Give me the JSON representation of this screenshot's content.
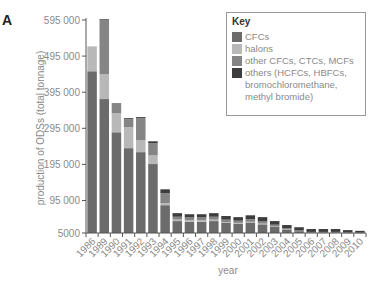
{
  "panel_label": "A",
  "legend": {
    "title": "Key",
    "items": [
      {
        "label": "CFCs",
        "color": "#6b6b6b"
      },
      {
        "label": "halons",
        "color": "#b8b8b8"
      },
      {
        "label": "other CFCs, CTCs, MCFs",
        "color": "#858585"
      },
      {
        "label": "others (HCFCs, HBFCs, bromochloromethane, methyl bromide)",
        "color": "#3d3d3d"
      }
    ]
  },
  "chart_data": {
    "type": "bar",
    "stacked": true,
    "title": "",
    "xlabel": "year",
    "ylabel": "production of ODSs (total tonnage)",
    "ylim": [
      5000,
      595000
    ],
    "yticks": [
      5000,
      95000,
      195000,
      295000,
      395000,
      495000,
      595000
    ],
    "ytick_labels": [
      "5000",
      "95 000",
      "195 000",
      "295 000",
      "395 000",
      "495 000",
      "595 000"
    ],
    "grid": false,
    "legend_position": "upper right",
    "categories": [
      "1986",
      "1989",
      "1990",
      "1991",
      "1992",
      "1993",
      "1994",
      "1995",
      "1996",
      "1997",
      "1998",
      "1999",
      "2000",
      "2001",
      "2002",
      "2003",
      "2004",
      "2005",
      "2006",
      "2007",
      "2008",
      "2009",
      "2010"
    ],
    "series": [
      {
        "name": "CFCs",
        "color": "#6b6b6b",
        "values": [
          448000,
          371000,
          279000,
          235000,
          224000,
          191000,
          77000,
          33000,
          31000,
          31000,
          33000,
          28000,
          26000,
          29000,
          24000,
          18000,
          9000,
          5000,
          2000,
          2000,
          2000,
          1000,
          1000
        ]
      },
      {
        "name": "halons",
        "color": "#b8b8b8",
        "values": [
          69000,
          69000,
          53000,
          58000,
          33000,
          24000,
          6000,
          4000,
          4000,
          4000,
          4000,
          2000,
          2000,
          2000,
          2000,
          1000,
          1000,
          0,
          0,
          0,
          0,
          0,
          0
        ]
      },
      {
        "name": "other CFCs, CTCs, MCFs",
        "color": "#858585",
        "values": [
          0,
          149000,
          28000,
          22000,
          61000,
          34000,
          27000,
          8000,
          8000,
          8000,
          8000,
          7000,
          6000,
          7000,
          6000,
          4000,
          3000,
          2000,
          1000,
          1000,
          1000,
          1000,
          0
        ]
      },
      {
        "name": "others (HCFCs, HBFCs, bromochloromethane, methyl bromide)",
        "color": "#3d3d3d",
        "values": [
          0,
          3000,
          0,
          3000,
          3000,
          5000,
          11000,
          10000,
          9000,
          9000,
          10000,
          10000,
          10000,
          11000,
          12000,
          10000,
          9000,
          9000,
          8000,
          8000,
          8000,
          6000,
          5000
        ]
      }
    ]
  }
}
